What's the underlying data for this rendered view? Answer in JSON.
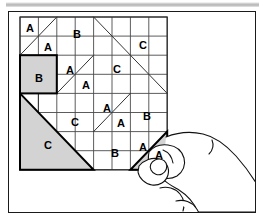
{
  "scene": {
    "title": "Tangram grid puzzle with hand placing piece",
    "description": "An 8 by 8 square grid containing shaded geometric puzzle pieces labelled A, B and C, with a hand holding a shaded triangular piece labelled A at the lower right corner of the grid."
  },
  "colors": {
    "ink": "#111111",
    "grid_line": "#4a4a4a",
    "piece_fill": "#d3d3d3",
    "piece_outline": "#000000",
    "paper": "#ffffff",
    "frame": "#1a1a1a",
    "top_bar": "#bdbdbd"
  },
  "grid": {
    "columns": 8,
    "rows": 8,
    "origin_x": 20,
    "origin_y": 17,
    "cell_width": 18.4,
    "cell_height": 19.1
  },
  "labels": [
    {
      "id": "lbl-1",
      "text": "A",
      "x": 30,
      "y": 28
    },
    {
      "id": "lbl-2",
      "text": "A",
      "x": 48,
      "y": 47
    },
    {
      "id": "lbl-3",
      "text": "B",
      "x": 77,
      "y": 34
    },
    {
      "id": "lbl-4",
      "text": "C",
      "x": 143,
      "y": 45
    },
    {
      "id": "lbl-5",
      "text": "B",
      "x": 39,
      "y": 78
    },
    {
      "id": "lbl-6",
      "text": "A",
      "x": 70,
      "y": 70
    },
    {
      "id": "lbl-7",
      "text": "A",
      "x": 86,
      "y": 85
    },
    {
      "id": "lbl-8",
      "text": "C",
      "x": 117,
      "y": 69
    },
    {
      "id": "lbl-9",
      "text": "A",
      "x": 107,
      "y": 108
    },
    {
      "id": "lbl-10",
      "text": "A",
      "x": 121,
      "y": 123
    },
    {
      "id": "lbl-11",
      "text": "C",
      "x": 75,
      "y": 122
    },
    {
      "id": "lbl-12",
      "text": "B",
      "x": 147,
      "y": 116
    },
    {
      "id": "lbl-13",
      "text": "C",
      "x": 48,
      "y": 145
    },
    {
      "id": "lbl-14",
      "text": "B",
      "x": 115,
      "y": 153
    },
    {
      "id": "lbl-15",
      "text": "A",
      "x": 143,
      "y": 147
    },
    {
      "id": "lbl-16",
      "text": "A",
      "x": 159,
      "y": 155
    }
  ],
  "pieces": [
    {
      "id": "piece-b-square",
      "label": "B",
      "shape": "square",
      "shaded": true
    },
    {
      "id": "piece-c-large-triangle",
      "label": "C",
      "shape": "right-triangle",
      "shaded": true
    },
    {
      "id": "piece-a-held-triangle",
      "label": "A",
      "shape": "right-triangle",
      "shaded": true,
      "held_by_hand": true
    }
  ],
  "hand": {
    "id": "hand",
    "description": "Right hand with thumb and index finger pinching the shaded triangle piece",
    "enters_from": "right-edge"
  }
}
